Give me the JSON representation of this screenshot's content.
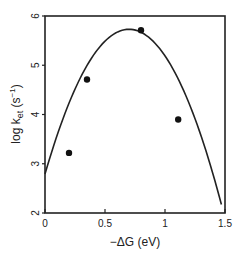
{
  "chart_data": {
    "type": "scatter",
    "title": "",
    "xlabel": "−ΔG (eV)",
    "ylabel_parts": {
      "main": "log k",
      "sub": "et",
      "units": " (s",
      "sup": "−1",
      "close": ")"
    },
    "ylabel": "log k_et (s^-1)",
    "xlim": [
      0,
      1.5
    ],
    "ylim": [
      2,
      6
    ],
    "xticks": [
      {
        "value": 0,
        "label": "0"
      },
      {
        "value": 0.5,
        "label": "0.5"
      },
      {
        "value": 1,
        "label": "1"
      },
      {
        "value": 1.5,
        "label": "1.5"
      }
    ],
    "yticks": [
      {
        "value": 2,
        "label": "2"
      },
      {
        "value": 3,
        "label": "3"
      },
      {
        "value": 4,
        "label": "4"
      },
      {
        "value": 5,
        "label": "5"
      },
      {
        "value": 6,
        "label": "6"
      }
    ],
    "grid": false,
    "series": [
      {
        "name": "measured",
        "type": "scatter",
        "points": [
          {
            "x": 0.2,
            "y": 3.22
          },
          {
            "x": 0.35,
            "y": 4.71
          },
          {
            "x": 0.8,
            "y": 5.71
          },
          {
            "x": 1.11,
            "y": 3.9
          }
        ]
      },
      {
        "name": "marcus-fit",
        "type": "line",
        "model": "parabola",
        "peak_x": 0.7,
        "peak_y": 5.73,
        "curvature": 6.0,
        "x_range": [
          0,
          1.47
        ]
      }
    ]
  }
}
